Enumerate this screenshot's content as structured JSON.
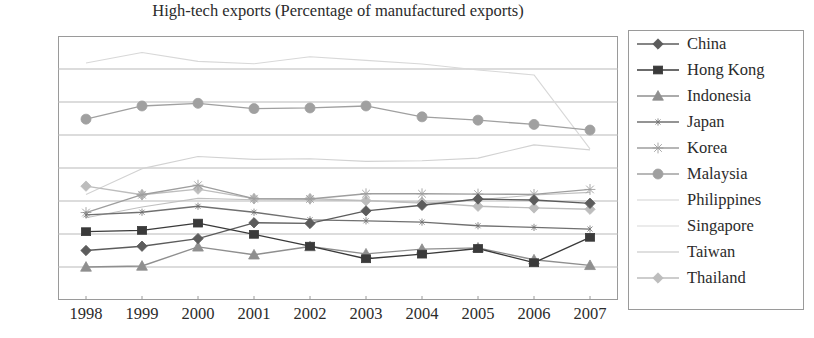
{
  "chart_data": {
    "type": "line",
    "title": "High-tech exports (Percentage of manufactured exports)",
    "xlabel": "",
    "ylabel": "",
    "grid": true,
    "legend_position": "right",
    "ylim": [
      0,
      80
    ],
    "ytick_step": 10,
    "ytick_labels": [
      "80.00",
      "70.00",
      "60.00",
      "50.00",
      "40.00",
      "30.00",
      "20.00",
      "10.00",
      "0.00"
    ],
    "ytick_values": [
      80,
      70,
      60,
      50,
      40,
      30,
      20,
      10,
      0
    ],
    "categories": [
      "1998",
      "1999",
      "2000",
      "2001",
      "2002",
      "2003",
      "2004",
      "2005",
      "2006",
      "2007"
    ],
    "series": [
      {
        "name": "China",
        "marker": "diamond",
        "color": "#5c5c5c",
        "values": [
          15.0,
          16.3,
          18.6,
          23.4,
          23.2,
          27.0,
          28.7,
          30.6,
          30.3,
          29.3
        ]
      },
      {
        "name": "Hong Kong",
        "marker": "square",
        "color": "#3a3a3a",
        "values": [
          20.7,
          21.1,
          23.3,
          19.9,
          16.3,
          12.5,
          13.9,
          15.6,
          11.3,
          19.0
        ]
      },
      {
        "name": "Indonesia",
        "marker": "triangle",
        "color": "#8f8f8f",
        "values": [
          10.0,
          10.3,
          16.1,
          13.7,
          16.2,
          14.0,
          15.4,
          15.8,
          12.2,
          10.5
        ]
      },
      {
        "name": "Japan",
        "marker": "cross-thin",
        "color": "#707070",
        "values": [
          25.8,
          26.6,
          28.4,
          26.6,
          24.3,
          24.0,
          23.6,
          22.5,
          22.0,
          21.5
        ]
      },
      {
        "name": "Korea",
        "marker": "asterisk",
        "color": "#9e9e9e",
        "values": [
          26.5,
          31.9,
          34.8,
          30.7,
          30.6,
          32.2,
          32.2,
          32.1,
          32.0,
          33.5
        ]
      },
      {
        "name": "Malaysia",
        "marker": "circle",
        "color": "#a0a0a0",
        "values": [
          54.8,
          58.8,
          59.6,
          58.0,
          58.2,
          58.8,
          55.5,
          54.5,
          53.2,
          51.5
        ]
      },
      {
        "name": "Philippines",
        "marker": "none",
        "color": "#d2d2d2",
        "values": [
          32.0,
          39.8,
          43.5,
          42.6,
          42.8,
          42.0,
          42.2,
          43.0,
          47.0,
          45.5
        ]
      },
      {
        "name": "Singapore",
        "marker": "none",
        "color": "#d8d8d8",
        "values": [
          71.8,
          75.0,
          72.3,
          71.6,
          73.7,
          72.6,
          71.5,
          69.7,
          68.2,
          45.8
        ]
      },
      {
        "name": "Taiwan",
        "marker": "none",
        "color": "#c0c0c0",
        "values": [
          24.9,
          28.2,
          30.8,
          30.4,
          30.3,
          30.1,
          29.3,
          30.4,
          31.8,
          32.6
        ]
      },
      {
        "name": "Thailand",
        "marker": "diamond-light",
        "color": "#bdbdbd",
        "values": [
          34.5,
          31.9,
          33.6,
          30.7,
          30.7,
          30.1,
          29.6,
          28.4,
          27.9,
          27.5
        ]
      }
    ]
  },
  "legend": {
    "items": [
      {
        "label": "China"
      },
      {
        "label": "Hong Kong"
      },
      {
        "label": "Indonesia"
      },
      {
        "label": "Japan"
      },
      {
        "label": "Korea"
      },
      {
        "label": "Malaysia"
      },
      {
        "label": "Philippines"
      },
      {
        "label": "Singapore"
      },
      {
        "label": "Taiwan"
      },
      {
        "label": "Thailand"
      }
    ]
  }
}
